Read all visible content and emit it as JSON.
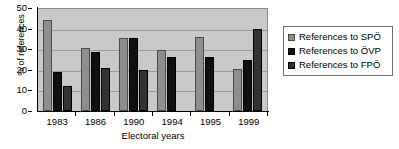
{
  "chart_data": {
    "type": "bar",
    "title": "",
    "subtitle": "",
    "xlabel": "Electoral years",
    "ylabel": "% of references",
    "categories": [
      "1983",
      "1986",
      "1990",
      "1994",
      "1995",
      "1999"
    ],
    "series": [
      {
        "name": "References to SPÖ",
        "color": "#8e8e8e",
        "values": [
          44,
          30.5,
          35.5,
          29.5,
          36,
          20.5
        ]
      },
      {
        "name": "References to ÖVP",
        "color": "#101010",
        "values": [
          19,
          28.5,
          35.5,
          26,
          26,
          25
        ]
      },
      {
        "name": "References to FPÖ",
        "color": "#333333",
        "values": [
          12,
          21,
          20,
          0,
          0,
          40
        ]
      }
    ],
    "ylim": [
      0,
      50
    ],
    "yticks": [
      0,
      10,
      20,
      30,
      40,
      50
    ],
    "ytick_labels": [
      "0",
      "10",
      "20",
      "30",
      "40",
      "50"
    ],
    "grid": true,
    "grid_axis": "y",
    "legend_position": "right",
    "plot_background": "#c9c9c9",
    "grid_color": "#9b9b9b",
    "figure_background": "#ffffff"
  }
}
